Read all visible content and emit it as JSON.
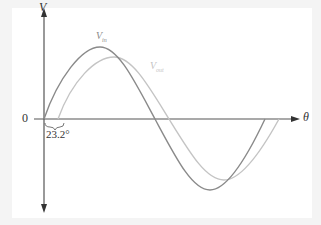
{
  "figure": {
    "axis_y_label": "V",
    "axis_x_label": "θ",
    "origin_label": "0",
    "phase_label": "23.2°",
    "series": [
      {
        "name": "V_in",
        "label_main": "V",
        "label_sub": "in",
        "color": "#8a8a8a"
      },
      {
        "name": "V_out",
        "label_main": "V",
        "label_sub": "out",
        "color": "#c4c4c4"
      }
    ],
    "phase_shift_deg": 23.2
  }
}
